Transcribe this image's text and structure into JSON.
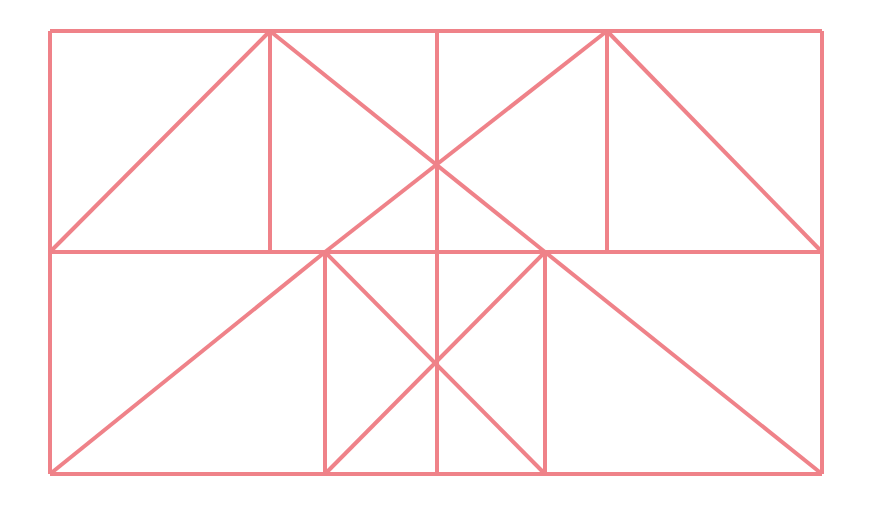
{
  "figure": {
    "canvas": {
      "width": 869,
      "height": 509,
      "background": "#ffffff"
    },
    "style": {
      "stroke_color": "#ef8289",
      "stroke_width": 4,
      "fill": "none"
    },
    "bounds": {
      "left": 50,
      "top": 31,
      "right": 822,
      "bottom": 474
    },
    "key_points": {
      "top_left": [
        50,
        31
      ],
      "top_right": [
        822,
        31
      ],
      "bottom_left": [
        50,
        474
      ],
      "bottom_right": [
        822,
        474
      ],
      "mid_left": [
        50,
        252
      ],
      "mid_right": [
        822,
        252
      ],
      "upper_apex_left": [
        270,
        31
      ],
      "upper_apex_right": [
        607,
        31
      ],
      "upper_center_x": [
        437,
        166
      ],
      "mid_inner_left": [
        325,
        252
      ],
      "mid_inner_right": [
        545,
        252
      ],
      "lower_center_x": [
        437,
        363
      ],
      "bottom_inner_left": [
        325,
        474
      ],
      "bottom_inner_center": [
        437,
        474
      ],
      "bottom_inner_right": [
        545,
        474
      ],
      "top_center": [
        437,
        31
      ]
    },
    "segments": [
      {
        "name": "outer-top-edge",
        "x1": 50,
        "y1": 31,
        "x2": 822,
        "y2": 31
      },
      {
        "name": "outer-bottom-edge",
        "x1": 50,
        "y1": 474,
        "x2": 822,
        "y2": 474
      },
      {
        "name": "outer-left-edge",
        "x1": 50,
        "y1": 31,
        "x2": 50,
        "y2": 474
      },
      {
        "name": "outer-right-edge",
        "x1": 822,
        "y1": 31,
        "x2": 822,
        "y2": 474
      },
      {
        "name": "middle-horizontal-divider",
        "x1": 50,
        "y1": 252,
        "x2": 822,
        "y2": 252
      },
      {
        "name": "upper-left-apex-vertical",
        "x1": 270,
        "y1": 31,
        "x2": 270,
        "y2": 252
      },
      {
        "name": "upper-center-vertical",
        "x1": 437,
        "y1": 31,
        "x2": 437,
        "y2": 252
      },
      {
        "name": "upper-right-apex-vertical",
        "x1": 607,
        "y1": 31,
        "x2": 607,
        "y2": 252
      },
      {
        "name": "upper-left-hypotenuse",
        "x1": 50,
        "y1": 252,
        "x2": 270,
        "y2": 31
      },
      {
        "name": "upper-long-diagonal-down",
        "x1": 270,
        "y1": 31,
        "x2": 545,
        "y2": 252
      },
      {
        "name": "upper-long-diagonal-up",
        "x1": 325,
        "y1": 252,
        "x2": 607,
        "y2": 31
      },
      {
        "name": "upper-right-hypotenuse",
        "x1": 607,
        "y1": 31,
        "x2": 822,
        "y2": 252
      },
      {
        "name": "lower-left-hypotenuse",
        "x1": 50,
        "y1": 474,
        "x2": 325,
        "y2": 252
      },
      {
        "name": "lower-right-hypotenuse",
        "x1": 545,
        "y1": 252,
        "x2": 822,
        "y2": 474
      },
      {
        "name": "lower-inner-left-vertical",
        "x1": 325,
        "y1": 252,
        "x2": 325,
        "y2": 474
      },
      {
        "name": "lower-center-vertical",
        "x1": 437,
        "y1": 252,
        "x2": 437,
        "y2": 474
      },
      {
        "name": "lower-inner-right-vertical",
        "x1": 545,
        "y1": 252,
        "x2": 545,
        "y2": 474
      },
      {
        "name": "lower-square-diagonal-nw-se",
        "x1": 325,
        "y1": 252,
        "x2": 545,
        "y2": 474
      },
      {
        "name": "lower-square-diagonal-sw-ne",
        "x1": 325,
        "y1": 474,
        "x2": 545,
        "y2": 252
      }
    ]
  }
}
